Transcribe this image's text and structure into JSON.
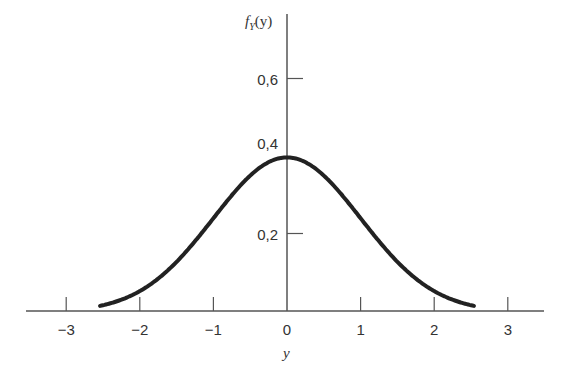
{
  "chart_data": {
    "type": "line",
    "title": "",
    "xlabel": "y",
    "ylabel": "f_Y(y)",
    "ylabel_main": "f",
    "ylabel_sub": "Y",
    "ylabel_arg": "(y)",
    "xlim": [
      -3.5,
      3.5
    ],
    "ylim": [
      0,
      0.75
    ],
    "x_ticks": [
      -3,
      -2,
      -1,
      0,
      1,
      2,
      3
    ],
    "x_tick_labels": [
      "−3",
      "−2",
      "−1",
      "0",
      "1",
      "2",
      "3"
    ],
    "y_ticks": [
      0.2,
      0.4,
      0.6
    ],
    "y_tick_labels": [
      "0,2",
      "0,4",
      "0,6"
    ],
    "grid": false,
    "legend": null,
    "series": [
      {
        "name": "standard normal density",
        "x": [
          -2.5,
          -2.0,
          -1.5,
          -1.0,
          -0.5,
          0,
          0.5,
          1.0,
          1.5,
          2.0,
          2.5
        ],
        "y": [
          0.018,
          0.054,
          0.13,
          0.242,
          0.352,
          0.399,
          0.352,
          0.242,
          0.13,
          0.054,
          0.018
        ]
      }
    ]
  },
  "colors": {
    "axis": "#555555",
    "curve": "#222222",
    "text": "#333333"
  }
}
